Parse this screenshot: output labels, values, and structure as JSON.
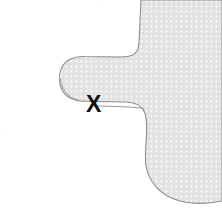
{
  "figure": {
    "title": "",
    "background_color": "#ffffff",
    "width": 222,
    "height": 210
  },
  "shape": {
    "name": "dotted-region-blob",
    "fill_color": "#e2e2e2",
    "dot_color": "#ffffff",
    "outline_color": "#8c8c8c",
    "outline_width": 1.1,
    "description": "Shaded region with a finger-like lobe protruding to the left and a concave notch beneath it",
    "path": "M 222,0 L 141,0 C 139,16 139,34 137,47 C 136,53 131,57 123,57 L 82,57 C 70,56 60,65 60,78 C 60,92 70,102 82,101 L 128,102 C 140,103 146,110 146,122 C 147,139 143,152 145,166 C 150,184 168,198 186,201 C 199,203 212,202 222,200 Z",
    "lobe_underside_path": "M 62,86 C 63,94 70,101 80,101",
    "lower_edge_path": "M 222,0 L 141,0"
  },
  "marker": {
    "label": "X",
    "name": "point-marker-x",
    "color": "#111111",
    "x": 95,
    "y": 105,
    "font_size_px": 23
  },
  "artifacts": {
    "top_mark": "·",
    "left_mark": "·"
  }
}
